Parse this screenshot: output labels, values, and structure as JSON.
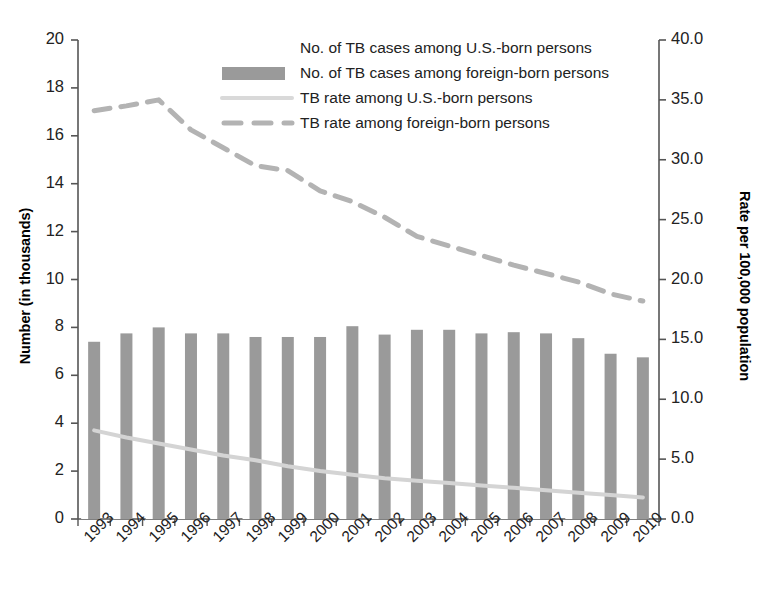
{
  "chart_data": {
    "type": "bar",
    "title": "",
    "subtitle": "",
    "xlabel": "",
    "ylabel": "Number (in thousands)",
    "y2label": "Rate per 100,000 population",
    "grid": false,
    "legend_position": "top-center",
    "ylim": [
      0,
      20
    ],
    "y2lim": [
      0,
      40
    ],
    "yticks": [
      "0",
      "2",
      "4",
      "6",
      "8",
      "10",
      "12",
      "14",
      "16",
      "18",
      "20"
    ],
    "y2ticks": [
      "0.0",
      "5.0",
      "10.0",
      "15.0",
      "20.0",
      "25.0",
      "30.0",
      "35.0",
      "40.0"
    ],
    "categories": [
      "1993",
      "1994",
      "1995",
      "1996",
      "1997",
      "1998",
      "1999",
      "2000",
      "2001",
      "2002",
      "2003",
      "2004",
      "2005",
      "2006",
      "2007",
      "2008",
      "2009",
      "2010"
    ],
    "series": [
      {
        "name": "No. of TB cases among U.S.-born persons",
        "kind": "bar",
        "axis": "left",
        "color": "#ffffff",
        "values": [
          17.0,
          16.0,
          14.8,
          13.5,
          12.4,
          11.5,
          10.5,
          9.6,
          9.0,
          8.4,
          7.9,
          7.5,
          7.2,
          6.9,
          6.5,
          6.1,
          5.6,
          5.2
        ]
      },
      {
        "name": "No. of TB cases among foreign-born persons",
        "kind": "bar",
        "axis": "left",
        "color": "#9a9a9a",
        "values": [
          7.4,
          7.75,
          8.0,
          7.75,
          7.75,
          7.6,
          7.6,
          7.6,
          8.05,
          7.7,
          7.9,
          7.9,
          7.75,
          7.8,
          7.75,
          7.55,
          6.9,
          6.75
        ]
      },
      {
        "name": "TB rate among U.S.-born persons",
        "kind": "line",
        "axis": "right",
        "color": "#d4d4d4",
        "dash": "solid",
        "values": [
          7.4,
          6.8,
          6.3,
          5.8,
          5.3,
          4.9,
          4.4,
          4.0,
          3.7,
          3.4,
          3.2,
          3.0,
          2.8,
          2.6,
          2.4,
          2.2,
          2.0,
          1.8
        ]
      },
      {
        "name": "TB rate among foreign-born persons",
        "kind": "line",
        "axis": "right",
        "color": "#b3b3b3",
        "dash": "dashed",
        "values": [
          34.1,
          34.5,
          35.0,
          32.5,
          31.0,
          29.5,
          29.1,
          27.4,
          26.5,
          25.2,
          23.6,
          22.8,
          22.0,
          21.2,
          20.5,
          19.8,
          18.8,
          18.2
        ]
      }
    ],
    "legend": [
      {
        "label": "No. of TB cases among U.S.-born persons",
        "marker": "bar-swatch",
        "color": "#ffffff"
      },
      {
        "label": "No. of TB cases among foreign-born persons",
        "marker": "bar-swatch",
        "color": "#9a9a9a"
      },
      {
        "label": "TB rate among U.S.-born persons",
        "marker": "line-solid",
        "color": "#d9d9d9"
      },
      {
        "label": "TB rate among foreign-born persons",
        "marker": "line-dashed",
        "color": "#b3b3b3"
      }
    ]
  }
}
